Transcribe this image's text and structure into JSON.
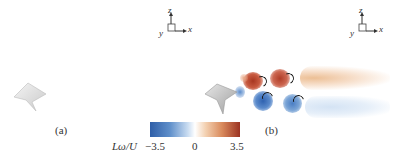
{
  "figure": {
    "panels": [
      {
        "label": "(a)",
        "axes": {
          "x": "x",
          "y": "y",
          "z": "z"
        }
      },
      {
        "label": "(b)",
        "axes": {
          "x": "x",
          "y": "y",
          "z": "z"
        }
      }
    ],
    "colorbar": {
      "title": "Lω",
      "title_suffix": "/U",
      "min_label": "−3.5",
      "mid_label": "0",
      "max_label": "3.5",
      "colors": {
        "negative": "#2f5fa8",
        "zero": "#ffffff",
        "positive": "#9b3322"
      }
    },
    "vortex_colors": {
      "positive_strong": "#b5412c",
      "negative_strong": "#3f72bd",
      "positive_faint": "#f3cba8",
      "negative_faint": "#d6e5f5"
    }
  }
}
